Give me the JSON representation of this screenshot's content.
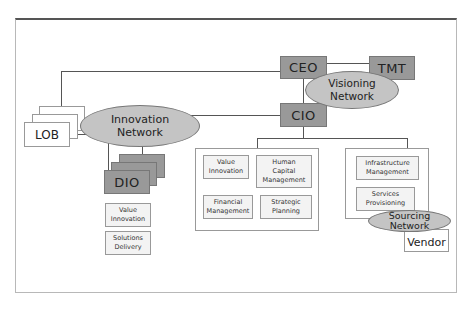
{
  "diagram": {
    "nodes": {
      "ceo": {
        "label": "CEO"
      },
      "tmt": {
        "label": "TMT"
      },
      "cio": {
        "label": "CIO"
      },
      "lob": {
        "label": "LOB"
      },
      "dio": {
        "label": "DIO"
      },
      "vendor": {
        "label": "Vendor"
      }
    },
    "networks": {
      "visioning": {
        "line1": "Visioning",
        "line2": "Network"
      },
      "innovation": {
        "line1": "Innovation",
        "line2": "Network"
      },
      "sourcing": {
        "line1": "Sourcing",
        "line2": "Network"
      }
    },
    "dio_functions": [
      {
        "line1": "Value",
        "line2": "Innovation"
      },
      {
        "line1": "Solutions",
        "line2": "Delivery"
      }
    ],
    "cio_functions": [
      {
        "line1": "Value",
        "line2": "Innovation",
        "line3": ""
      },
      {
        "line1": "Human",
        "line2": "Capital",
        "line3": "Management"
      },
      {
        "line1": "Financial",
        "line2": "Management",
        "line3": ""
      },
      {
        "line1": "Strategic",
        "line2": "Planning",
        "line3": ""
      }
    ],
    "sourcing_functions": [
      {
        "line1": "Infrastructure",
        "line2": "Management"
      },
      {
        "line1": "Services",
        "line2": "Provisioning"
      }
    ]
  }
}
